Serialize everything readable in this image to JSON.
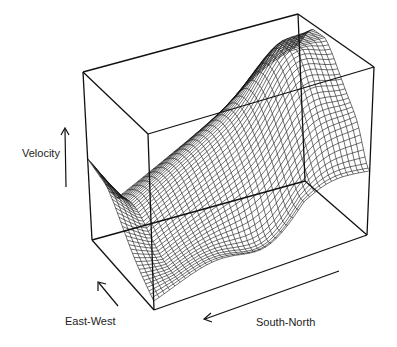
{
  "chart_data": {
    "type": "surface",
    "title": "",
    "axes": {
      "x": {
        "label": "South-North",
        "range": [
          0,
          1
        ]
      },
      "y": {
        "label": "East-West",
        "range": [
          0,
          1
        ]
      },
      "z": {
        "label": "Velocity",
        "range": [
          0,
          1
        ]
      }
    },
    "grid": {
      "rows": 40,
      "cols": 40
    },
    "surface_description": "wireframe velocity surface rising from low at South end to peak near North end, with a ridge along the far side",
    "line_color": "#111111",
    "box_color": "#111111",
    "axis_labels": {
      "velocity": "Velocity",
      "east_west": "East-West",
      "south_north": "South-North"
    }
  }
}
